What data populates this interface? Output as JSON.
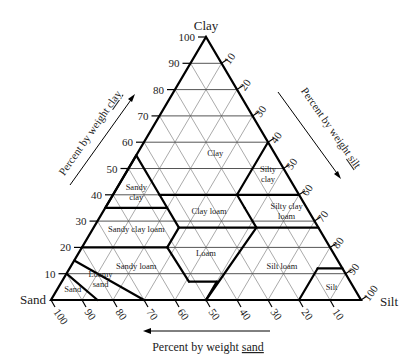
{
  "vertices": {
    "clay": {
      "label": "Clay",
      "x": 206,
      "y": 37
    },
    "sand": {
      "label": "Sand",
      "x": 51,
      "y": 300
    },
    "silt": {
      "label": "Silt",
      "x": 361,
      "y": 300
    }
  },
  "axes": {
    "clay": {
      "title": "Percent by weight clay",
      "underlined_word": "clay",
      "ticks": [
        10,
        20,
        30,
        40,
        50,
        60,
        70,
        80,
        90,
        100
      ]
    },
    "silt": {
      "title": "Percent by weight silt",
      "underlined_word": "silt",
      "ticks": [
        10,
        20,
        30,
        40,
        50,
        60,
        70,
        80,
        90,
        100
      ]
    },
    "sand": {
      "title": "Percent by weight sand",
      "underlined_word": "sand",
      "ticks": [
        100,
        90,
        80,
        70,
        60,
        50,
        40,
        30,
        20,
        10
      ]
    }
  },
  "regions": [
    {
      "name": "Clay",
      "label": "Clay",
      "label_pos": [
        19,
        25,
        56
      ]
    },
    {
      "name": "Sandy clay",
      "label": "Sandy\nclay",
      "label_pos": [
        52,
        7,
        41
      ]
    },
    {
      "name": "Silty clay",
      "label": "Silty\nclay",
      "label_pos": [
        6,
        46,
        48
      ]
    },
    {
      "name": "Clay loam",
      "label": "Clay loam",
      "label_pos": [
        32,
        34,
        34
      ]
    },
    {
      "name": "Silty clay loam",
      "label": "Silty clay\nloam",
      "label_pos": [
        7,
        59,
        34
      ]
    },
    {
      "name": "Sandy clay loam",
      "label": "Sandy clay loam",
      "label_pos": [
        59,
        14,
        27
      ]
    },
    {
      "name": "Loam",
      "label": "Loam",
      "label_pos": [
        41,
        41,
        18
      ]
    },
    {
      "name": "Sandy loam",
      "label": "Sandy loam",
      "label_pos": [
        66,
        21,
        13
      ]
    },
    {
      "name": "Silt loam",
      "label": "Silt loam",
      "label_pos": [
        19,
        68,
        13
      ]
    },
    {
      "name": "Loamy sand",
      "label": "Loamy\nsand",
      "label_pos": [
        80,
        12,
        8
      ]
    },
    {
      "name": "Sand",
      "label": "Sand",
      "label_pos": [
        91,
        5,
        4
      ]
    },
    {
      "name": "Silt",
      "label": "Silt",
      "label_pos": [
        7,
        88,
        5
      ]
    }
  ],
  "boundaries": [
    [
      [
        45,
        0,
        55
      ],
      [
        65,
        0,
        35
      ]
    ],
    [
      [
        45,
        0,
        55
      ],
      [
        45,
        15,
        40
      ]
    ],
    [
      [
        45,
        15,
        40
      ],
      [
        20,
        40,
        40
      ]
    ],
    [
      [
        20,
        40,
        40
      ],
      [
        0,
        40,
        60
      ]
    ],
    [
      [
        20,
        40,
        40
      ],
      [
        0,
        60,
        40
      ]
    ],
    [
      [
        45,
        15,
        40
      ],
      [
        45,
        27.5,
        27.5
      ]
    ],
    [
      [
        65,
        0,
        35
      ],
      [
        45,
        20,
        35
      ]
    ],
    [
      [
        45,
        27.5,
        27.5
      ],
      [
        20,
        52.5,
        27.5
      ]
    ],
    [
      [
        20,
        52.5,
        27.5
      ],
      [
        20,
        45,
        35
      ]
    ],
    [
      [
        20,
        40,
        40
      ],
      [
        20,
        45,
        35
      ]
    ],
    [
      [
        20,
        52.5,
        27.5
      ],
      [
        0,
        72.5,
        27.5
      ]
    ],
    [
      [
        45,
        27.5,
        27.5
      ],
      [
        52.5,
        27.5,
        20
      ]
    ],
    [
      [
        52.5,
        27.5,
        20
      ],
      [
        80,
        0,
        20
      ]
    ],
    [
      [
        52.5,
        27.5,
        20
      ],
      [
        52,
        41,
        7
      ]
    ],
    [
      [
        52,
        41,
        7
      ],
      [
        43,
        50,
        7
      ]
    ],
    [
      [
        43,
        50,
        7
      ],
      [
        50,
        50,
        0
      ]
    ],
    [
      [
        20,
        52.5,
        27.5
      ],
      [
        50,
        50,
        0
      ]
    ],
    [
      [
        20,
        80,
        0
      ],
      [
        8,
        80,
        12
      ]
    ],
    [
      [
        8,
        80,
        12
      ],
      [
        0,
        88,
        12
      ]
    ],
    [
      [
        85,
        0,
        15
      ],
      [
        70,
        30,
        0
      ]
    ],
    [
      [
        90,
        0,
        10
      ],
      [
        85,
        15,
        0
      ]
    ]
  ]
}
